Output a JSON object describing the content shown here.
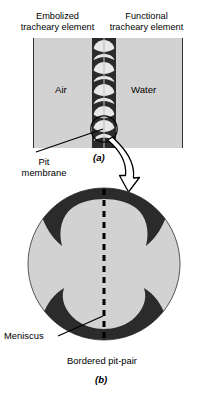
{
  "figure": {
    "title_absent": true,
    "panel_a": {
      "letter": "(a)",
      "left_header": "Embolized\ntracheary element",
      "left_header_line1": "Embolized",
      "left_header_line2": "tracheary element",
      "right_header_line1": "Functional",
      "right_header_line2": "tracheary element",
      "left_chamber_label": "Air",
      "right_chamber_label": "Water",
      "callout_label_line1": "Pit",
      "callout_label_line2": "membrane",
      "pit_count": 5,
      "highlighted_pit_index": 5
    },
    "panel_b": {
      "letter": "(b)",
      "label_meniscus": "Meniscus",
      "label_bordered_pit_pair": "Bordered pit-pair",
      "center_line_style": "dashed"
    },
    "colors": {
      "chamber_fill": "#d2d2d2",
      "wall_dark": "#2b2b2b",
      "pit_lumen": "#e8e8e8",
      "panel_b_fill": "#d2d2d2",
      "outline": "#000000",
      "background": "#ffffff"
    }
  }
}
